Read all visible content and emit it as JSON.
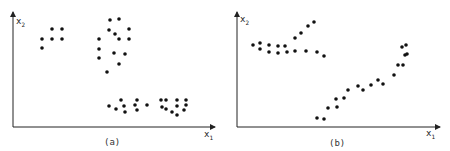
{
  "chart_data": [
    {
      "type": "scatter",
      "title": "",
      "caption": "(a)",
      "xlabel": "x1",
      "ylabel": "x2",
      "grid": false,
      "legend": null,
      "axes_px": {
        "origin": [
          13,
          127
        ],
        "x_end": 215,
        "y_end": 12
      },
      "series": [
        {
          "name": "cluster-1",
          "points": [
            [
              42,
              39
            ],
            [
              52,
              29
            ],
            [
              62,
              29
            ],
            [
              52,
              39
            ],
            [
              62,
              39
            ],
            [
              42,
              48
            ]
          ]
        },
        {
          "name": "cluster-2",
          "points": [
            [
              110,
              20
            ],
            [
              119,
              19
            ],
            [
              109,
              30
            ],
            [
              115,
              34
            ],
            [
              129,
              29
            ],
            [
              99,
              39
            ],
            [
              119,
              39
            ],
            [
              129,
              39
            ],
            [
              99,
              49
            ],
            [
              114,
              53
            ],
            [
              125,
              54
            ],
            [
              99,
              58
            ],
            [
              119,
              64
            ],
            [
              107,
              72
            ]
          ]
        },
        {
          "name": "cluster-3",
          "points": [
            [
              109,
              106
            ],
            [
              116,
              109
            ],
            [
              121,
              100
            ],
            [
              124,
              106
            ],
            [
              125,
              112
            ],
            [
              135,
              105
            ],
            [
              137,
              100
            ],
            [
              137,
              110
            ],
            [
              147,
              105
            ]
          ]
        },
        {
          "name": "cluster-4",
          "points": [
            [
              161,
              100
            ],
            [
              166,
              100
            ],
            [
              177,
              100
            ],
            [
              186,
              100
            ],
            [
              162,
              107
            ],
            [
              166,
              109
            ],
            [
              172,
              112
            ],
            [
              177,
              106
            ],
            [
              177,
              115
            ],
            [
              184,
              110
            ],
            [
              186,
              105
            ]
          ]
        }
      ]
    },
    {
      "type": "scatter",
      "title": "",
      "caption": "(b)",
      "xlabel": "x1",
      "ylabel": "x2",
      "grid": false,
      "legend": null,
      "axes_px": {
        "origin": [
          237,
          127
        ],
        "x_end": 440,
        "y_end": 12
      },
      "series": [
        {
          "name": "upper-band",
          "points": [
            [
              253,
              45
            ],
            [
              260,
              43
            ],
            [
              260,
              49
            ],
            [
              269,
              45
            ],
            [
              269,
              52
            ],
            [
              278,
              46
            ],
            [
              278,
              53
            ],
            [
              285,
              46
            ],
            [
              287,
              52
            ],
            [
              295,
              51
            ],
            [
              306,
              51
            ],
            [
              317,
              52
            ],
            [
              324,
              56
            ]
          ]
        },
        {
          "name": "rising-arm",
          "points": [
            [
              295,
              38
            ],
            [
              301,
              33
            ],
            [
              308,
              26
            ],
            [
              314,
              22
            ]
          ]
        },
        {
          "name": "lower-diagonal",
          "points": [
            [
              317,
              118
            ],
            [
              324,
              119
            ],
            [
              328,
              108
            ],
            [
              336,
              99
            ],
            [
              337,
              107
            ],
            [
              344,
              98
            ],
            [
              348,
              90
            ],
            [
              358,
              86
            ],
            [
              363,
              90
            ],
            [
              371,
              85
            ],
            [
              378,
              80
            ],
            [
              383,
              84
            ],
            [
              394,
              75
            ],
            [
              398,
              65
            ],
            [
              402,
              47
            ],
            [
              403,
              65
            ],
            [
              405,
              55
            ],
            [
              406,
              45
            ],
            [
              407,
              54
            ]
          ]
        }
      ]
    }
  ],
  "labels": {
    "a": {
      "x_main": "x",
      "x_sub": "1",
      "y_main": "x",
      "y_sub": "2",
      "caption": "(a)"
    },
    "b": {
      "x_main": "x",
      "x_sub": "1",
      "y_main": "x",
      "y_sub": "2",
      "caption": "(b)"
    }
  },
  "style": {
    "point_color": "#111111",
    "axis_color": "#222222",
    "background": "#ffffff"
  }
}
